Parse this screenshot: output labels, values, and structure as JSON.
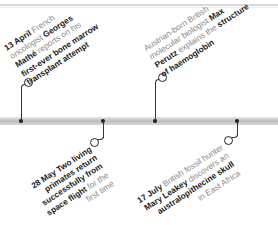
{
  "timeline": {
    "events": [
      {
        "position": "above",
        "date": "13 April",
        "lines": [
          [
            {
              "t": "13 April",
              "b": true
            },
            {
              "t": " French",
              "b": false
            }
          ],
          [
            {
              "t": "oncologist ",
              "b": false
            },
            {
              "t": "Georges",
              "b": true
            }
          ],
          [
            {
              "t": "Mathé",
              "b": true
            },
            {
              "t": " reports on his",
              "b": false
            }
          ],
          [
            {
              "t": "first-ever bone marrow",
              "b": true
            }
          ],
          [
            {
              "t": "transplant attempt",
              "b": true
            }
          ]
        ]
      },
      {
        "position": "below",
        "date": "28 May",
        "lines": [
          [
            {
              "t": "28 May",
              "b": true
            },
            {
              "t": " Two living",
              "b": true
            }
          ],
          [
            {
              "t": "primates return",
              "b": true
            }
          ],
          [
            {
              "t": "successfully from",
              "b": true
            }
          ],
          [
            {
              "t": "space flight",
              "b": true
            },
            {
              "t": " for the",
              "b": false
            }
          ],
          [
            {
              "t": "first time",
              "b": false
            }
          ]
        ]
      },
      {
        "position": "above",
        "date": "",
        "lines": [
          [
            {
              "t": "Austrian-born British",
              "b": false
            }
          ],
          [
            {
              "t": "molecular biologist ",
              "b": false
            },
            {
              "t": "Max",
              "b": true
            }
          ],
          [
            {
              "t": "Perutz",
              "b": true
            },
            {
              "t": " explains the ",
              "b": false
            },
            {
              "t": "structure",
              "b": true
            }
          ],
          [
            {
              "t": "of haemoglobin",
              "b": true
            }
          ]
        ]
      },
      {
        "position": "below",
        "date": "17 July",
        "lines": [
          [
            {
              "t": "17 July",
              "b": true
            },
            {
              "t": " British fossil hunter",
              "b": false
            }
          ],
          [
            {
              "t": "Mary Leakey",
              "b": true
            },
            {
              "t": " discovers an",
              "b": false
            }
          ],
          [
            {
              "t": "australopithecine skull",
              "b": true
            }
          ],
          [
            {
              "t": "in East Africa",
              "b": false
            }
          ]
        ]
      }
    ]
  }
}
